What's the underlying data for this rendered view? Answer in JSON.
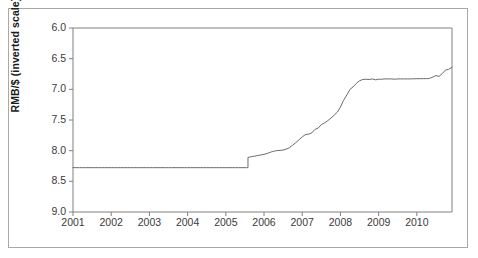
{
  "chart_data": {
    "type": "line",
    "title": "",
    "xlabel": "",
    "ylabel": "RMB/$ (inverted scale)",
    "inverted_y": true,
    "ylim": [
      6.0,
      9.0
    ],
    "xlim": [
      2001,
      2010.92
    ],
    "grid": false,
    "legend": null,
    "yticks": [
      "6.0",
      "6.5",
      "7.0",
      "7.5",
      "8.0",
      "8.5",
      "9.0"
    ],
    "ytick_values": [
      6.0,
      6.5,
      7.0,
      7.5,
      8.0,
      8.5,
      9.0
    ],
    "xticks": [
      "2001",
      "2002",
      "2003",
      "2004",
      "2005",
      "2006",
      "2007",
      "2008",
      "2009",
      "2010"
    ],
    "xtick_values": [
      2001,
      2002,
      2003,
      2004,
      2005,
      2006,
      2007,
      2008,
      2009,
      2010
    ],
    "series": [
      {
        "name": "RMB per US dollar",
        "color": "#6b6b6b",
        "x": [
          2001.0,
          2001.08,
          2001.17,
          2001.25,
          2001.33,
          2001.42,
          2001.5,
          2001.58,
          2001.67,
          2001.75,
          2001.83,
          2001.92,
          2002.0,
          2002.08,
          2002.17,
          2002.25,
          2002.33,
          2002.42,
          2002.5,
          2002.58,
          2002.67,
          2002.75,
          2002.83,
          2002.92,
          2003.0,
          2003.08,
          2003.17,
          2003.25,
          2003.33,
          2003.42,
          2003.5,
          2003.58,
          2003.67,
          2003.75,
          2003.83,
          2003.92,
          2004.0,
          2004.08,
          2004.17,
          2004.25,
          2004.33,
          2004.42,
          2004.5,
          2004.58,
          2004.67,
          2004.75,
          2004.83,
          2004.92,
          2005.0,
          2005.08,
          2005.17,
          2005.25,
          2005.33,
          2005.42,
          2005.54,
          2005.58,
          2005.58,
          2005.62,
          2005.67,
          2005.75,
          2005.83,
          2005.92,
          2006.0,
          2006.08,
          2006.17,
          2006.25,
          2006.33,
          2006.42,
          2006.5,
          2006.58,
          2006.67,
          2006.75,
          2006.83,
          2006.92,
          2007.0,
          2007.08,
          2007.17,
          2007.25,
          2007.33,
          2007.42,
          2007.5,
          2007.58,
          2007.67,
          2007.75,
          2007.83,
          2007.92,
          2008.0,
          2008.08,
          2008.17,
          2008.25,
          2008.33,
          2008.42,
          2008.5,
          2008.58,
          2008.67,
          2008.75,
          2008.83,
          2008.92,
          2009.0,
          2009.08,
          2009.17,
          2009.25,
          2009.33,
          2009.42,
          2009.5,
          2009.58,
          2009.67,
          2009.75,
          2009.83,
          2009.92,
          2010.0,
          2010.08,
          2010.17,
          2010.25,
          2010.33,
          2010.42,
          2010.5,
          2010.58,
          2010.67,
          2010.75,
          2010.83,
          2010.92
        ],
        "y": [
          8.277,
          8.277,
          8.277,
          8.277,
          8.277,
          8.277,
          8.277,
          8.277,
          8.277,
          8.277,
          8.277,
          8.277,
          8.277,
          8.277,
          8.277,
          8.277,
          8.277,
          8.277,
          8.277,
          8.277,
          8.277,
          8.277,
          8.277,
          8.277,
          8.277,
          8.277,
          8.277,
          8.277,
          8.277,
          8.277,
          8.277,
          8.277,
          8.277,
          8.277,
          8.277,
          8.277,
          8.277,
          8.277,
          8.277,
          8.277,
          8.277,
          8.277,
          8.277,
          8.277,
          8.277,
          8.277,
          8.277,
          8.277,
          8.277,
          8.277,
          8.277,
          8.277,
          8.277,
          8.277,
          8.277,
          8.277,
          8.11,
          8.105,
          8.098,
          8.09,
          8.08,
          8.07,
          8.06,
          8.046,
          8.025,
          8.01,
          8.0,
          7.995,
          7.99,
          7.975,
          7.95,
          7.91,
          7.87,
          7.82,
          7.775,
          7.74,
          7.73,
          7.71,
          7.655,
          7.63,
          7.575,
          7.55,
          7.51,
          7.47,
          7.425,
          7.37,
          7.29,
          7.18,
          7.09,
          7.0,
          6.96,
          6.9,
          6.86,
          6.84,
          6.835,
          6.84,
          6.83,
          6.845,
          6.835,
          6.835,
          6.83,
          6.83,
          6.83,
          6.835,
          6.83,
          6.83,
          6.83,
          6.83,
          6.83,
          6.828,
          6.827,
          6.826,
          6.826,
          6.826,
          6.822,
          6.8,
          6.775,
          6.79,
          6.74,
          6.685,
          6.675,
          6.64
        ]
      }
    ],
    "annotations": [
      {
        "label": "peg level",
        "value": 8.277
      },
      {
        "label": "July 2005 revaluation step",
        "x": 2005.58,
        "from": 8.277,
        "to": 8.11
      },
      {
        "label": "crisis plateau",
        "value": 6.83
      },
      {
        "label": "final value",
        "value": 6.64
      }
    ]
  },
  "axes": {
    "ylabel": "RMB/$ (inverted scale)",
    "ytick_labels": [
      "6.0",
      "6.5",
      "7.0",
      "7.5",
      "8.0",
      "8.5",
      "9.0"
    ],
    "xtick_labels": [
      "2001",
      "2002",
      "2003",
      "2004",
      "2005",
      "2006",
      "2007",
      "2008",
      "2009",
      "2010"
    ]
  },
  "style": {
    "line_color": "#6b6b6b",
    "axis_color": "#808080",
    "border_color": "#a9a9a9",
    "text_color": "#3a3a3a",
    "background": "#ffffff"
  }
}
